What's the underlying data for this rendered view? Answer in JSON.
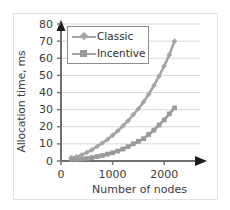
{
  "chart_data": {
    "type": "line",
    "title": "",
    "xlabel": "Number of nodes",
    "ylabel": "Allocation time, ms",
    "xlim": [
      0,
      2500
    ],
    "ylim": [
      0,
      80
    ],
    "xticks": [
      0,
      1000,
      2000
    ],
    "yticks": [
      0,
      10,
      20,
      30,
      40,
      50,
      60,
      70,
      80
    ],
    "xtick_labels": [
      "0",
      "1000",
      "2000"
    ],
    "ytick_labels": [
      "0",
      "10",
      "20",
      "30",
      "40",
      "50",
      "60",
      "70",
      "80"
    ],
    "grid": "horizontal",
    "legend_position": "top-left-inside",
    "series": [
      {
        "name": "Classic",
        "marker": "diamond",
        "color": "#a5a5a5",
        "x": [
          200,
          300,
          400,
          500,
          600,
          700,
          800,
          900,
          1000,
          1100,
          1200,
          1300,
          1400,
          1500,
          1600,
          1700,
          1800,
          1900,
          2000,
          2100,
          2200
        ],
        "y": [
          2,
          2.5,
          3.5,
          5,
          6.5,
          8.5,
          10.5,
          12.5,
          15,
          17.5,
          20.5,
          23.5,
          27,
          30.5,
          34.5,
          39,
          44,
          49.5,
          55.5,
          62,
          70
        ]
      },
      {
        "name": "Incentive",
        "marker": "square",
        "color": "#9a9a9a",
        "x": [
          200,
          300,
          400,
          500,
          600,
          700,
          800,
          900,
          1000,
          1100,
          1200,
          1300,
          1400,
          1500,
          1600,
          1700,
          1800,
          1900,
          2000,
          2100,
          2200
        ],
        "y": [
          1,
          1,
          1.2,
          1.5,
          2,
          2.6,
          3.2,
          4,
          4.8,
          5.8,
          7,
          8.4,
          10,
          11.5,
          13,
          15.5,
          18,
          21,
          24,
          27.5,
          31
        ]
      }
    ]
  },
  "legend": {
    "items": [
      {
        "label": "Classic"
      },
      {
        "label": "Incentive"
      }
    ]
  },
  "axes": {
    "y_title": "Allocation time, ms",
    "x_title": "Number of nodes"
  },
  "colors": {
    "series_classic": "#a5a5a5",
    "series_incentive": "#9a9a9a",
    "axis": "#6f6f6f",
    "gridline": "#d9d9d9",
    "text": "#3b3b3b",
    "border": "#e2e2e2"
  }
}
